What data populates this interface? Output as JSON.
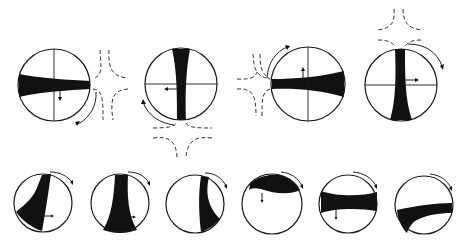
{
  "figure": {
    "colors": {
      "ink": "#111111",
      "background": "#ffffff",
      "dashed": "#333333"
    },
    "top_row": [
      {
        "id": "t1",
        "cx": 54,
        "cy": 85,
        "r": 36,
        "band": "horizontal, widening to left",
        "flow_region": "right",
        "rotation_arrow": "clockwise, lower-right",
        "small_arrow": "down"
      },
      {
        "id": "t2",
        "cx": 181,
        "cy": 84,
        "r": 36,
        "band": "vertical, widening to top",
        "flow_region": "bottom",
        "rotation_arrow": "lower-left",
        "small_arrow": "left"
      },
      {
        "id": "t3",
        "cx": 308,
        "cy": 84,
        "r": 37,
        "band": "horizontal, widening to right",
        "flow_region": "left",
        "rotation_arrow": "upper-left",
        "small_arrow": "up"
      },
      {
        "id": "t4",
        "cx": 401,
        "cy": 85,
        "r": 36,
        "band": "vertical, widening to bottom",
        "flow_region": "top",
        "rotation_arrow": "upper-right",
        "small_arrow": "right"
      }
    ],
    "bottom_row": [
      {
        "id": "b1",
        "cx": 43,
        "cy": 203,
        "r": 29,
        "band": "tilted, curving to lower-left"
      },
      {
        "id": "b2",
        "cx": 120,
        "cy": 203,
        "r": 29,
        "band": "vertical, widening to bottom"
      },
      {
        "id": "b3",
        "cx": 195,
        "cy": 204,
        "r": 29,
        "band": "vertical right side, curving to lower-right"
      },
      {
        "id": "b4",
        "cx": 272,
        "cy": 204,
        "r": 30,
        "band": "arc near top"
      },
      {
        "id": "b5",
        "cx": 348,
        "cy": 204,
        "r": 29,
        "band": "horizontal, slightly above center"
      },
      {
        "id": "b6",
        "cx": 424,
        "cy": 205,
        "r": 29,
        "band": "curved, lower half"
      }
    ]
  }
}
